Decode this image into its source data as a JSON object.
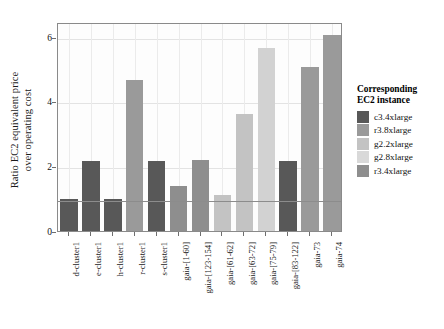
{
  "chart_data": {
    "type": "bar",
    "title": "",
    "xlabel": "",
    "ylabel": "Ratio EC2 equivalent price\nover operating cost",
    "ylabel_line1": "Ratio EC2 equivalent price",
    "ylabel_line2": "over operating cost",
    "ylim": [
      0,
      6.45
    ],
    "yticks": [
      0,
      2,
      4,
      6
    ],
    "ytick_labels": [
      "0",
      "2",
      "4",
      "6"
    ],
    "grid": true,
    "reference_line": 1,
    "categories": [
      "d-cluster1",
      "e-cluster1",
      "h-cluster1",
      "r-cluster1",
      "s-cluster1",
      "gaia-[1-60]",
      "gaia-[123-154]",
      "gaia-[61-62]",
      "gaia-[63-72]",
      "gaia-[75-79]",
      "gaia-[83-122]",
      "gaia-73",
      "gaia-74"
    ],
    "values": [
      1.0,
      2.15,
      1.0,
      4.65,
      2.15,
      1.4,
      2.2,
      1.1,
      3.6,
      5.65,
      2.15,
      5.05,
      6.05
    ],
    "bar_instances": [
      "c3.4xlarge",
      "c3.4xlarge",
      "c3.4xlarge",
      "r3.8xlarge",
      "c3.4xlarge",
      "r3.4xlarge",
      "r3.4xlarge",
      "g2.2xlarge",
      "g2.2xlarge",
      "g2.8xlarge",
      "c3.4xlarge",
      "r3.4xlarge",
      "r3.4xlarge"
    ],
    "bar_colors": [
      "#585858",
      "#585858",
      "#585858",
      "#9a9a9a",
      "#585858",
      "#8e8e8e",
      "#8e8e8e",
      "#c3c3c3",
      "#c3c3c3",
      "#d2d2d2",
      "#585858",
      "#9a9a9a",
      "#9a9a9a"
    ],
    "legend": {
      "title_line1": "Corresponding",
      "title_line2": "EC2 instance",
      "position": "right",
      "entries": [
        {
          "label": "c3.4xlarge",
          "color": "#585858"
        },
        {
          "label": "r3.8xlarge",
          "color": "#9a9a9a"
        },
        {
          "label": "g2.2xlarge",
          "color": "#c3c3c3"
        },
        {
          "label": "g2.8xlarge",
          "color": "#d9d9d9"
        },
        {
          "label": "r3.4xlarge",
          "color": "#8e8e8e"
        }
      ]
    }
  }
}
